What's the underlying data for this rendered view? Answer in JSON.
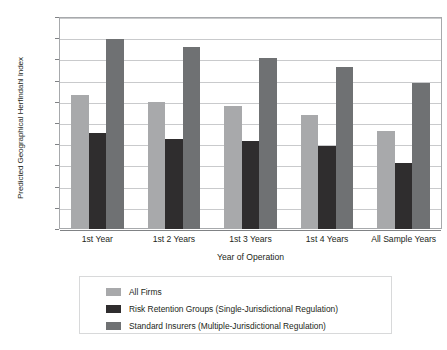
{
  "chart_data": {
    "type": "bar",
    "title": "",
    "xlabel": "Year of Operation",
    "ylabel": "Predicted Geographical Herfindahl Index",
    "categories": [
      "1st Year",
      "1st 2 Years",
      "1st 3 Years",
      "1st 4 Years",
      "All Sample Years"
    ],
    "series": [
      {
        "name": "All Firms",
        "color": "#a8a9ab",
        "values": [
          0.816,
          0.8,
          0.79,
          0.77,
          0.732
        ]
      },
      {
        "name": "Risk Retention Groups (Single-Jurisdictional Regulation)",
        "color": "#2f2d2e",
        "values": [
          0.726,
          0.712,
          0.707,
          0.695,
          0.655
        ]
      },
      {
        "name": "Standard Insurers (Multiple-Jurisdictional Regulation)",
        "color": "#6f7173",
        "values": [
          0.948,
          0.93,
          0.903,
          0.882,
          0.845
        ]
      }
    ],
    "ylim": [
      0.5,
      1.0
    ],
    "ytick_labels": [
      "1.000",
      "0.950",
      "0.900",
      "0.850",
      "0.800",
      "0.750",
      "0.700",
      "0.650",
      "0.600",
      "0.550",
      "0.500"
    ],
    "ytick_values": [
      1.0,
      0.95,
      0.9,
      0.85,
      0.8,
      0.75,
      0.7,
      0.65,
      0.6,
      0.55,
      0.5
    ],
    "grid": true,
    "legend_position": "bottom"
  }
}
